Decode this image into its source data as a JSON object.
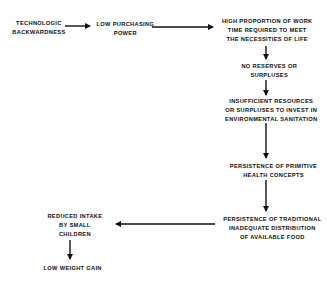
{
  "diagram": {
    "type": "flowchart",
    "nodes": [
      {
        "id": "n1",
        "lines": [
          "TECHNOLOGIC",
          "BACKWARDNESS"
        ]
      },
      {
        "id": "n2",
        "lines": [
          "LOW PURCHASING",
          "POWER"
        ]
      },
      {
        "id": "n3",
        "lines": [
          "HIGH PROPORTION OF WORK",
          "TIME REQUIRED TO MEET",
          "THE NECESSITIES OF LIFE"
        ]
      },
      {
        "id": "n4",
        "lines": [
          "NO RESERVES OR",
          "SURPLUSES"
        ]
      },
      {
        "id": "n5",
        "lines": [
          "INSUFFICIENT RESOURCES",
          "OR SURPLUSES TO INVEST IN",
          "ENVIRONMENTAL SANITATION"
        ]
      },
      {
        "id": "n6",
        "lines": [
          "PERSISTENCE OF PRIMITIVE",
          "HEALTH CONCEPTS"
        ]
      },
      {
        "id": "n7",
        "lines": [
          "PERSISTENCE OF TRADITIONAL",
          "INADEQUATE DISTRIBUTION",
          "OF AVAILABLE FOOD"
        ]
      },
      {
        "id": "n8",
        "lines": [
          "REDUCED INTAKE",
          "BY SMALL",
          "CHILDREN"
        ]
      },
      {
        "id": "n9",
        "lines": [
          "LOW WEIGHT GAIN"
        ]
      }
    ],
    "edges": [
      {
        "from": "n1",
        "to": "n2"
      },
      {
        "from": "n2",
        "to": "n3"
      },
      {
        "from": "n3",
        "to": "n4"
      },
      {
        "from": "n4",
        "to": "n5"
      },
      {
        "from": "n5",
        "to": "n6"
      },
      {
        "from": "n6",
        "to": "n7"
      },
      {
        "from": "n7",
        "to": "n8"
      },
      {
        "from": "n8",
        "to": "n9"
      }
    ]
  }
}
